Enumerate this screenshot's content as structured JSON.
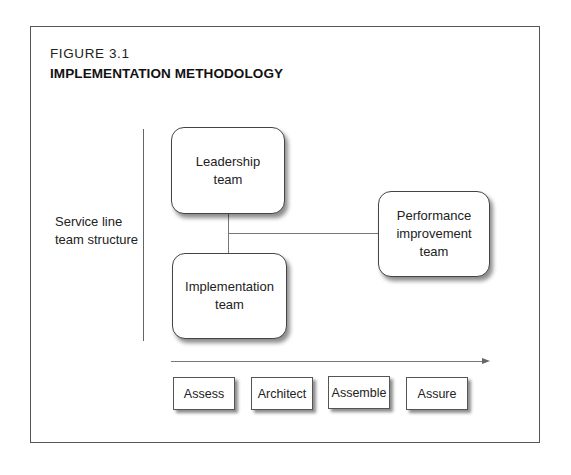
{
  "figure": {
    "number": "FIGURE 3.1",
    "title": "IMPLEMENTATION METHODOLOGY"
  },
  "side_label": {
    "line1": "Service line",
    "line2": "team structure"
  },
  "teams": [
    {
      "id": "leadership",
      "line1": "Leadership",
      "line2": "team"
    },
    {
      "id": "implementation",
      "line1": "Implementation",
      "line2": "team"
    },
    {
      "id": "performance",
      "line1": "Performance",
      "line2": "improvement",
      "line3": "team"
    }
  ],
  "phases": [
    {
      "label": "Assess"
    },
    {
      "label": "Architect"
    },
    {
      "label": "Assemble"
    },
    {
      "label": "Assure"
    }
  ],
  "timeline": {
    "direction": "right-arrow"
  }
}
